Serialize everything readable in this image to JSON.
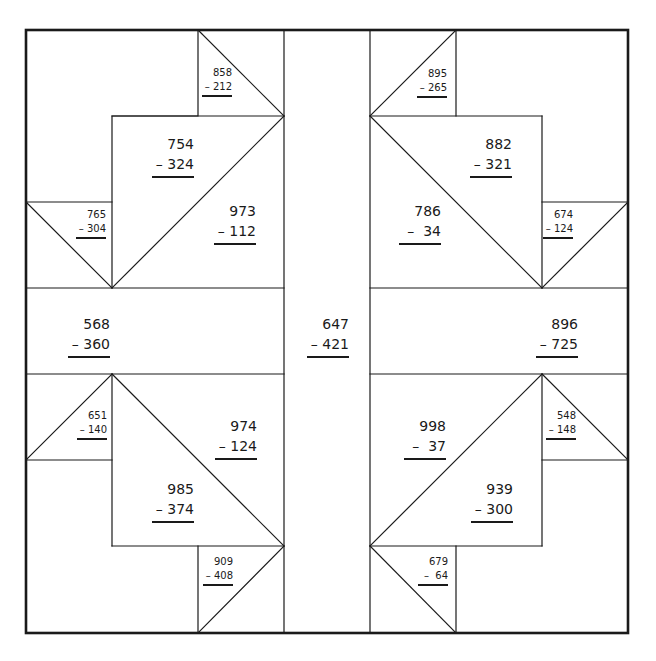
{
  "worksheet": {
    "problems": [
      {
        "id": "p1",
        "top": "858",
        "bottom": "212",
        "size": "small",
        "right": 232,
        "y": 66
      },
      {
        "id": "p2",
        "top": "754",
        "bottom": "324",
        "size": "large",
        "right": 194,
        "y": 134
      },
      {
        "id": "p3",
        "top": "765",
        "bottom": "304",
        "size": "small",
        "right": 106,
        "y": 208
      },
      {
        "id": "p4",
        "top": "973",
        "bottom": "112",
        "size": "large",
        "right": 256,
        "y": 201
      },
      {
        "id": "p5",
        "top": "895",
        "bottom": "265",
        "size": "small",
        "right": 447,
        "y": 67
      },
      {
        "id": "p6",
        "top": "882",
        "bottom": "321",
        "size": "large",
        "right": 512,
        "y": 134
      },
      {
        "id": "p7",
        "top": "786",
        "bottom": " 34",
        "size": "large",
        "right": 441,
        "y": 201
      },
      {
        "id": "p8",
        "top": "674",
        "bottom": "124",
        "size": "small",
        "right": 573,
        "y": 208
      },
      {
        "id": "p9",
        "top": "568",
        "bottom": "360",
        "size": "large",
        "right": 110,
        "y": 314
      },
      {
        "id": "p10",
        "top": "647",
        "bottom": "421",
        "size": "large",
        "right": 349,
        "y": 314
      },
      {
        "id": "p11",
        "top": "896",
        "bottom": "725",
        "size": "large",
        "right": 578,
        "y": 314
      },
      {
        "id": "p12",
        "top": "651",
        "bottom": "140",
        "size": "small",
        "right": 107,
        "y": 409
      },
      {
        "id": "p13",
        "top": "974",
        "bottom": "124",
        "size": "large",
        "right": 257,
        "y": 416
      },
      {
        "id": "p14",
        "top": "998",
        "bottom": " 37",
        "size": "large",
        "right": 446,
        "y": 416
      },
      {
        "id": "p15",
        "top": "548",
        "bottom": "148",
        "size": "small",
        "right": 576,
        "y": 409
      },
      {
        "id": "p16",
        "top": "985",
        "bottom": "374",
        "size": "large",
        "right": 194,
        "y": 479
      },
      {
        "id": "p17",
        "top": "939",
        "bottom": "300",
        "size": "large",
        "right": 513,
        "y": 479
      },
      {
        "id": "p18",
        "top": "909",
        "bottom": "408",
        "size": "small",
        "right": 233,
        "y": 555
      },
      {
        "id": "p19",
        "top": "679",
        "bottom": " 64",
        "size": "small",
        "right": 448,
        "y": 555
      }
    ],
    "operator": "–"
  },
  "colors": {
    "line": "#1a1a1a",
    "background": "#ffffff"
  }
}
